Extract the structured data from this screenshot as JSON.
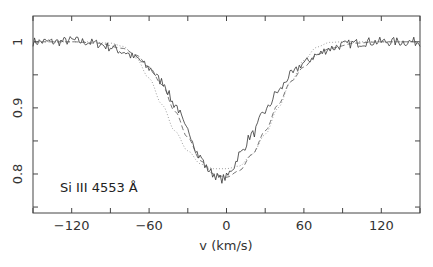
{
  "chart_data": {
    "type": "line",
    "title": "",
    "xlabel": "v (km/s)",
    "ylabel": "",
    "xlim": [
      -150,
      150
    ],
    "ylim": [
      0.741,
      1.039
    ],
    "xticks": [
      -120,
      -60,
      0,
      60,
      120
    ],
    "xticks_minor": [
      -150,
      -90,
      -30,
      30,
      90,
      150
    ],
    "xtick_labels": [
      "−120",
      "−60",
      "0",
      "60",
      "120"
    ],
    "yticks": [
      0.8,
      0.9,
      1.0
    ],
    "yticks_minor": [
      0.75,
      0.85,
      0.95
    ],
    "ytick_labels": [
      "0.8",
      "0.9",
      "1"
    ],
    "grid": false,
    "annotation": "Si III 4553 Å",
    "series": [
      {
        "name": "observed",
        "style": "solid",
        "x": [
          -150,
          -140,
          -130,
          -120,
          -110,
          -100,
          -90,
          -80,
          -70,
          -60,
          -50,
          -40,
          -30,
          -20,
          -15,
          -10,
          -5,
          0,
          5,
          10,
          20,
          30,
          40,
          50,
          60,
          70,
          80,
          90,
          100,
          110,
          120,
          130,
          140,
          150
        ],
        "values": [
          1.0,
          1.0,
          1.0,
          1.002,
          1.0,
          0.997,
          0.992,
          0.985,
          0.975,
          0.96,
          0.94,
          0.905,
          0.865,
          0.825,
          0.808,
          0.8,
          0.792,
          0.795,
          0.81,
          0.83,
          0.86,
          0.895,
          0.925,
          0.95,
          0.968,
          0.98,
          0.99,
          0.995,
          0.998,
          1.0,
          1.0,
          1.0,
          1.0,
          1.0
        ]
      },
      {
        "name": "model-dashed",
        "style": "dashed",
        "x": [
          -150,
          -120,
          -100,
          -80,
          -70,
          -60,
          -50,
          -40,
          -30,
          -20,
          -10,
          0,
          10,
          20,
          30,
          40,
          50,
          60,
          70,
          80,
          100,
          120,
          150
        ],
        "values": [
          1.0,
          1.0,
          0.998,
          0.99,
          0.98,
          0.962,
          0.935,
          0.895,
          0.855,
          0.82,
          0.8,
          0.795,
          0.805,
          0.83,
          0.865,
          0.905,
          0.94,
          0.962,
          0.98,
          0.99,
          0.998,
          1.0,
          1.0
        ]
      },
      {
        "name": "model-dotted",
        "style": "dotted",
        "x": [
          -150,
          -110,
          -90,
          -80,
          -70,
          -60,
          -50,
          -40,
          -30,
          -20,
          -10,
          0,
          10,
          20,
          30,
          40,
          50,
          60,
          70,
          80,
          90,
          110,
          150
        ],
        "values": [
          1.0,
          1.0,
          0.998,
          0.993,
          0.975,
          0.945,
          0.905,
          0.865,
          0.835,
          0.815,
          0.808,
          0.808,
          0.812,
          0.83,
          0.86,
          0.9,
          0.94,
          0.972,
          0.992,
          0.999,
          1.0,
          1.0,
          1.0
        ]
      }
    ]
  },
  "frame": {
    "left": 33,
    "right": 420,
    "top": 16,
    "bottom": 213
  },
  "colors": {
    "line": "#333333",
    "axis": "#444444",
    "dotted": "#888888",
    "dashed": "#555555"
  }
}
